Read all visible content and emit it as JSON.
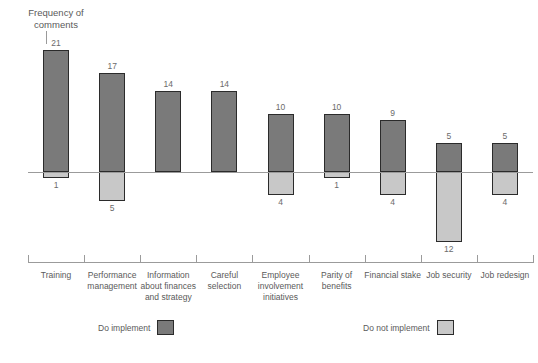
{
  "title": {
    "line1": "Frequency of",
    "line2": "comments"
  },
  "legend": {
    "implement_label": "Do implement",
    "not_implement_label": "Do not implement",
    "implement_color": "#7a7a7a",
    "not_implement_color": "#c8c8c8"
  },
  "chart_data": {
    "type": "bar",
    "title": "Frequency of comments",
    "xlabel": "",
    "ylabel": "Frequency of comments",
    "grid": false,
    "legend_position": "bottom",
    "baseline": 0,
    "ylim": [
      -14,
      22
    ],
    "categories": [
      "Training",
      "Performance management",
      "Information about finances and strategy",
      "Careful selection",
      "Employee involvement initiatives",
      "Parity of benefits",
      "Financial stake",
      "Job security",
      "Job redesign"
    ],
    "series": [
      {
        "name": "Do implement",
        "color": "#7a7a7a",
        "direction": "up",
        "values": [
          21,
          17,
          14,
          14,
          10,
          10,
          9,
          5,
          5
        ]
      },
      {
        "name": "Do not implement",
        "color": "#c8c8c8",
        "direction": "down",
        "values": [
          1,
          5,
          0,
          0,
          4,
          1,
          4,
          12,
          4
        ]
      }
    ]
  }
}
